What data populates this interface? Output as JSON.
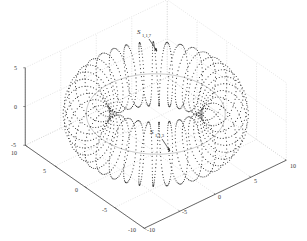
{
  "chart_data": {
    "type": "scatter3d",
    "title": "",
    "xlabel": "",
    "ylabel": "",
    "zlabel": "",
    "x_ticks": [
      "-10",
      "-5",
      "0",
      "5",
      "10"
    ],
    "y_ticks": [
      "-10",
      "-5",
      "0",
      "5",
      "10"
    ],
    "z_ticks": [
      "-5",
      "0",
      "5"
    ],
    "xlim": [
      -10,
      10
    ],
    "ylim": [
      -10,
      10
    ],
    "zlim": [
      -5,
      5
    ],
    "grid": true,
    "torus": {
      "major_radius": 7.5,
      "minor_radius": 2.5,
      "turns": 36
    },
    "annotations": [
      {
        "label": "S",
        "subscript": "1,1,7",
        "position": "back (top) of torus"
      },
      {
        "label": "S",
        "subscript": "1,1,3",
        "position": "front (bottom) of torus"
      }
    ],
    "colors": {
      "points": "#333333",
      "axes": "#444444",
      "grid": "#c8c8c8"
    }
  },
  "annotations": {
    "top": {
      "main": "S",
      "sub": "1,1,7"
    },
    "bottom": {
      "main": "S",
      "sub": "1,1,3"
    }
  },
  "ticks": {
    "z": [
      "5",
      "0",
      "-5"
    ],
    "left_axis": [
      "10",
      "5",
      "0",
      "-5",
      "-10"
    ],
    "right_axis": [
      "-10",
      "-5",
      "0",
      "5",
      "10"
    ]
  }
}
